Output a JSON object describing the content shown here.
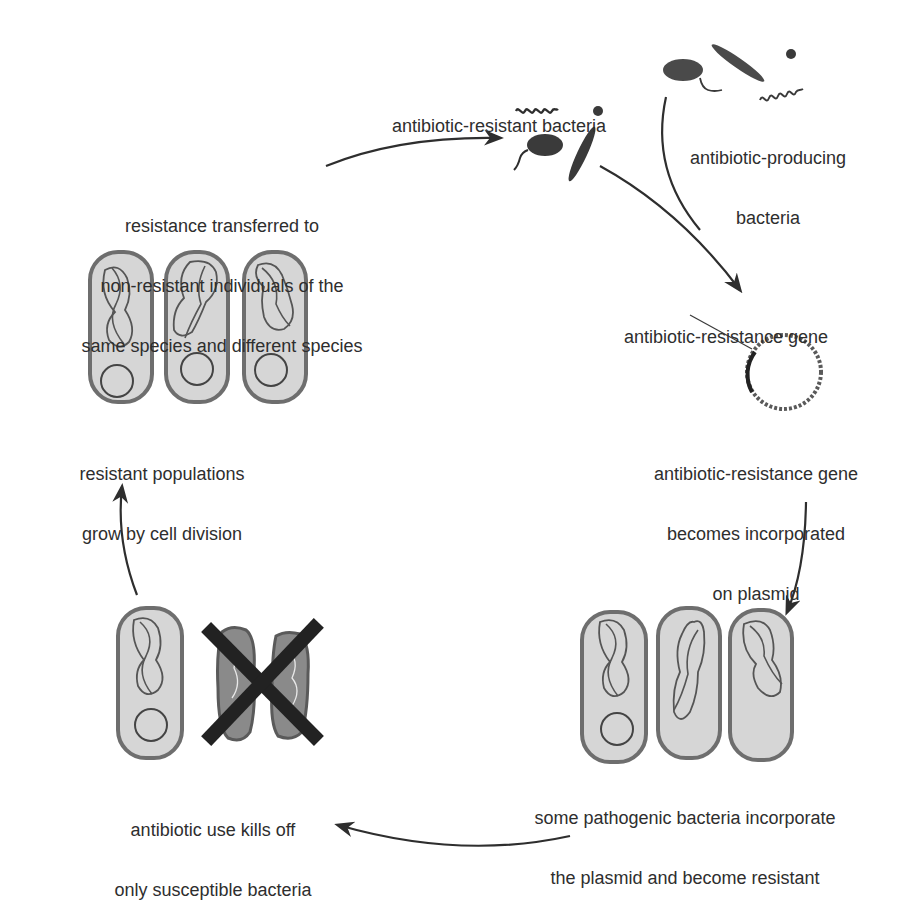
{
  "diagram": {
    "colors": {
      "ink": "#2e2e2e",
      "cell_fill": "#d6d6d6",
      "cell_border": "#6e6e6e",
      "dead_cell_fill": "#8a8a8a",
      "cross": "#222222",
      "background": "#ffffff"
    },
    "labels": {
      "resistant_bacteria": "antibiotic-resistant bacteria",
      "producing_bacteria": [
        "antibiotic-producing",
        "bacteria"
      ],
      "resistance_gene": "antibiotic-resistance gene",
      "gene_on_plasmid": [
        "antibiotic-resistance gene",
        "becomes incorporated",
        "on plasmid"
      ],
      "pathogens_incorporate": [
        "some pathogenic bacteria incorporate",
        "the plasmid and become resistant"
      ],
      "antibiotic_use": [
        "antibiotic use kills off",
        "only susceptible bacteria"
      ],
      "population_growth": [
        "resistant populations",
        "grow by cell division"
      ],
      "resistance_transfer": [
        "resistance transferred to",
        "non-resistant individuals of the",
        "same species and different species"
      ]
    },
    "stages": [
      {
        "id": "resistant-bacteria",
        "icons": [
          "spiral-bacterium",
          "flagellated-bacterium",
          "rod-bacterium",
          "coccus-bacterium"
        ]
      },
      {
        "id": "producing-bacteria",
        "icons": [
          "flagellated-bacterium",
          "rod-bacterium",
          "coccus-bacterium",
          "spiral-bacterium"
        ]
      },
      {
        "id": "plasmid",
        "icons": [
          "plasmid-ring"
        ]
      },
      {
        "id": "pathogenic-cells",
        "count": 3
      },
      {
        "id": "antibiotic-kill",
        "survivors": 1,
        "killed": 2
      },
      {
        "id": "resistant-population",
        "count": 3
      }
    ]
  }
}
